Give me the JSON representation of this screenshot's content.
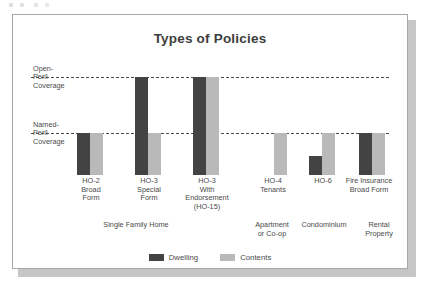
{
  "figure": {
    "title": "Types of Policies"
  },
  "axis": {
    "open_peril_label": "Open-\nPeril\nCoverage",
    "named_peril_label": "Named-\nPeril\nCoverage"
  },
  "legend": {
    "items": [
      {
        "label": "Dwelling",
        "color": "#434343",
        "key": "dwelling"
      },
      {
        "label": "Contents",
        "color": "#b9b9b9",
        "key": "contents"
      }
    ]
  },
  "group_labels": [
    {
      "text": "Single Family Home"
    },
    {
      "text": "Apartment\nor Co-op"
    },
    {
      "text": "Condominium"
    },
    {
      "text": "Rental\nProperty"
    }
  ],
  "chart_data": {
    "type": "bar",
    "title": "Types of Policies",
    "xlabel": "",
    "ylabel": "",
    "grid": true,
    "legend_position": "bottom-center",
    "y_levels": [
      {
        "name": "Named-Peril Coverage",
        "value": 1
      },
      {
        "name": "Open-Peril Coverage",
        "value": 2
      }
    ],
    "ylim": [
      0,
      2.35
    ],
    "categories": [
      "HO-2\nBroad\nForm",
      "HO-3\nSpecial\nForm",
      "HO-3\nWith\nEndorsement\n(HO-15)",
      "HO-4\nTenants",
      "HO-6",
      "Fire Insurance\nBroad Form"
    ],
    "series": [
      {
        "name": "Dwelling",
        "color": "#434343",
        "values": [
          1,
          2,
          2,
          0,
          0.45,
          1
        ]
      },
      {
        "name": "Contents",
        "color": "#b9b9b9",
        "values": [
          1,
          1,
          2,
          1,
          1,
          1
        ]
      }
    ],
    "groups": [
      {
        "label": "Single Family Home",
        "categories": [
          "HO-2 Broad Form",
          "HO-3 Special Form",
          "HO-3 With Endorsement (HO-15)"
        ]
      },
      {
        "label": "Apartment or Co-op",
        "categories": [
          "HO-4 Tenants"
        ]
      },
      {
        "label": "Condominium",
        "categories": [
          "HO-6"
        ]
      },
      {
        "label": "Rental Property",
        "categories": [
          "Fire Insurance Broad Form"
        ]
      }
    ]
  }
}
